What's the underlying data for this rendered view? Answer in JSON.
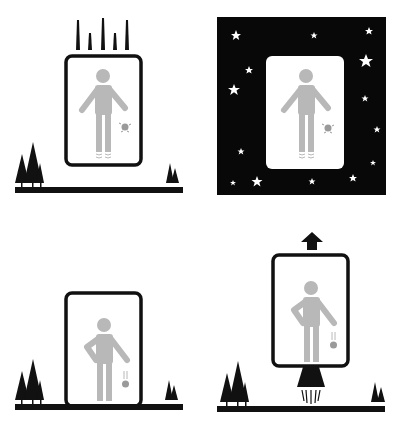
{
  "figure": {
    "colors": {
      "ink": "#111111",
      "figure_gray": "#b8b8b8",
      "object_gray": "#9a9a9a",
      "background": "#ffffff",
      "space": "#080808",
      "star": "#ffffff"
    },
    "panels": [
      {
        "id": "free-fall",
        "position": "top-left",
        "scene": "elevator falling near ground, speed lines above, object floating"
      },
      {
        "id": "space-inertial",
        "position": "top-right",
        "scene": "cabin floating in space among stars, object floating"
      },
      {
        "id": "resting-on-ground",
        "position": "bottom-left",
        "scene": "cabin resting on ground, object falls from hand"
      },
      {
        "id": "accelerating-rocket",
        "position": "bottom-right",
        "scene": "cabin with rocket thruster accelerating upward, object falls from hand"
      }
    ]
  }
}
